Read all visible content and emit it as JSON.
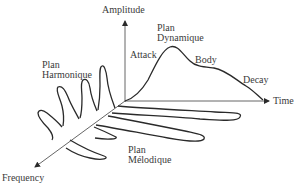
{
  "diagram": {
    "axes": {
      "amplitude": "Amplitude",
      "time": "Time",
      "frequency": "Frequency"
    },
    "planes": {
      "harmonic": {
        "line1": "Plan",
        "line2": "Harmonique"
      },
      "dynamic": {
        "line1": "Plan",
        "line2": "Dynamique"
      },
      "melodic": {
        "line1": "Plan",
        "line2": "Mélodique"
      }
    },
    "envelope_phases": {
      "attack": "Attack",
      "body": "Body",
      "decay": "Decay"
    },
    "colors": {
      "stroke": "#2a2a2a",
      "text": "#3a3a3a",
      "background": "#ffffff"
    }
  }
}
